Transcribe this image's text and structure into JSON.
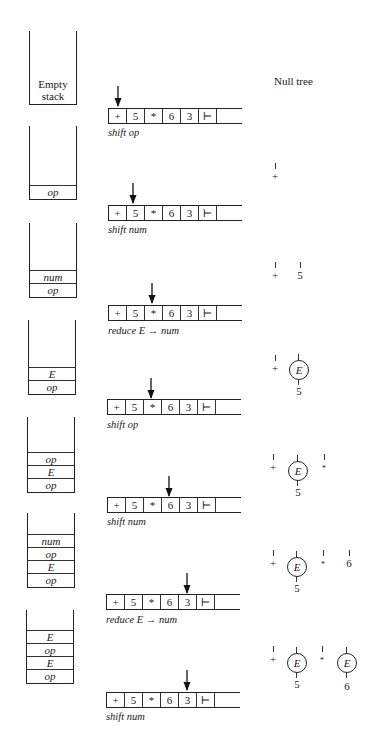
{
  "diagram": {
    "type": "shift-reduce parse trace",
    "input_tape": [
      "+",
      "5",
      "*",
      "6",
      "3",
      "⊢",
      ""
    ],
    "steps": [
      {
        "stack": [],
        "stack_empty_label": [
          "Empty",
          "stack"
        ],
        "pointer_index": 0,
        "action": "shift op",
        "forest_label": "Null tree"
      },
      {
        "stack": [
          "op"
        ],
        "pointer_index": 1,
        "action": "shift num",
        "forest": [
          "+"
        ]
      },
      {
        "stack": [
          "num",
          "op"
        ],
        "pointer_index": 2,
        "action": "reduce E → num",
        "forest": [
          "+",
          "5"
        ]
      },
      {
        "stack": [
          "E",
          "op"
        ],
        "pointer_index": 2,
        "action": "shift op",
        "forest": [
          "+",
          "E(5)"
        ]
      },
      {
        "stack": [
          "op",
          "E",
          "op"
        ],
        "pointer_index": 3,
        "action": "shift num",
        "forest": [
          "+",
          "E(5)",
          "*"
        ]
      },
      {
        "stack": [
          "num",
          "op",
          "E",
          "op"
        ],
        "pointer_index": 4,
        "action": "reduce E → num",
        "forest": [
          "+",
          "E(5)",
          "*",
          "6"
        ]
      },
      {
        "stack": [
          "E",
          "op",
          "E",
          "op"
        ],
        "pointer_index": 4,
        "action": "shift num",
        "forest": [
          "+",
          "E(5)",
          "*",
          "E(6)"
        ]
      }
    ],
    "node_labels": {
      "E": "E",
      "plus": "+",
      "times": "*",
      "five": "5",
      "six": "6"
    }
  }
}
